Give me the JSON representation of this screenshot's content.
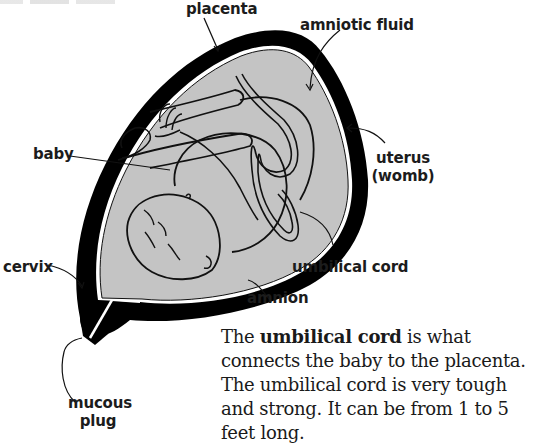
{
  "diagram": {
    "colors": {
      "uterus_wall": "#000000",
      "amniotic_fill": "#c4c4c4",
      "line": "#111111",
      "background": "#ffffff"
    },
    "labels": {
      "placenta": "placenta",
      "amniotic_fluid": "amniotic fluid",
      "baby": "baby",
      "uterus_line1": "uterus",
      "uterus_line2": "(womb)",
      "cervix": "cervix",
      "umbilical_cord": "umbilical cord",
      "amnion": "amnion",
      "mucous_plug_line1": "mucous",
      "mucous_plug_line2": "plug"
    }
  },
  "caption": {
    "prefix": "The ",
    "bold_term": "umbilical cord",
    "rest": " is what connects the baby to the placenta. The umbilical cord is very tough and strong. It can be from 1 to 5 feet long."
  }
}
